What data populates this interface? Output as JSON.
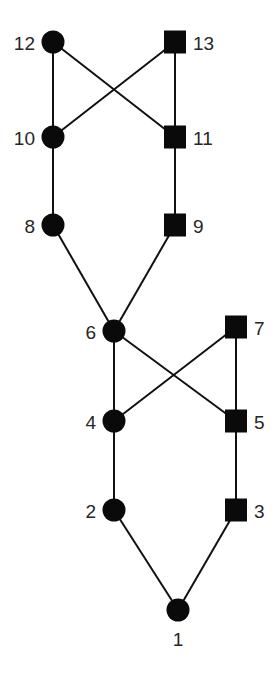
{
  "diagram": {
    "type": "graph",
    "colors": {
      "node_fill": "#0a0a0a",
      "edge": "#111111",
      "label": "#262626",
      "background": "#ffffff"
    },
    "nodes": [
      {
        "id": "1",
        "label": "1",
        "shape": "circle",
        "x": 178,
        "y": 610,
        "label_pos": "below"
      },
      {
        "id": "2",
        "label": "2",
        "shape": "circle",
        "x": 114,
        "y": 510,
        "label_pos": "left"
      },
      {
        "id": "3",
        "label": "3",
        "shape": "square",
        "x": 236,
        "y": 510,
        "label_pos": "right"
      },
      {
        "id": "4",
        "label": "4",
        "shape": "circle",
        "x": 114,
        "y": 421,
        "label_pos": "left"
      },
      {
        "id": "5",
        "label": "5",
        "shape": "square",
        "x": 236,
        "y": 421,
        "label_pos": "right"
      },
      {
        "id": "6",
        "label": "6",
        "shape": "circle",
        "x": 114,
        "y": 331,
        "label_pos": "left"
      },
      {
        "id": "7",
        "label": "7",
        "shape": "square",
        "x": 236,
        "y": 327,
        "label_pos": "right"
      },
      {
        "id": "8",
        "label": "8",
        "shape": "circle",
        "x": 53,
        "y": 225,
        "label_pos": "left"
      },
      {
        "id": "9",
        "label": "9",
        "shape": "square",
        "x": 175,
        "y": 225,
        "label_pos": "right"
      },
      {
        "id": "10",
        "label": "10",
        "shape": "circle",
        "x": 53,
        "y": 137,
        "label_pos": "left"
      },
      {
        "id": "11",
        "label": "11",
        "shape": "square",
        "x": 175,
        "y": 137,
        "label_pos": "right"
      },
      {
        "id": "12",
        "label": "12",
        "shape": "circle",
        "x": 53,
        "y": 42,
        "label_pos": "left"
      },
      {
        "id": "13",
        "label": "13",
        "shape": "square",
        "x": 175,
        "y": 42,
        "label_pos": "right"
      }
    ],
    "edges": [
      [
        "12",
        "10"
      ],
      [
        "12",
        "11"
      ],
      [
        "13",
        "10"
      ],
      [
        "13",
        "11"
      ],
      [
        "10",
        "8"
      ],
      [
        "11",
        "9"
      ],
      [
        "8",
        "6"
      ],
      [
        "9",
        "6"
      ],
      [
        "6",
        "4"
      ],
      [
        "6",
        "5"
      ],
      [
        "7",
        "4"
      ],
      [
        "7",
        "5"
      ],
      [
        "4",
        "2"
      ],
      [
        "5",
        "3"
      ],
      [
        "2",
        "1"
      ],
      [
        "3",
        "1"
      ]
    ]
  }
}
